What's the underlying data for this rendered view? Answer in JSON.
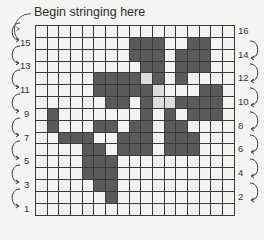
{
  "title": "Begin stringing here",
  "pattern": {
    "rows": 16,
    "cols": 17,
    "legend": {
      "0": "empty",
      "1": "filled",
      "2": "highlight"
    },
    "colors": {
      "empty": "#f2f2f1",
      "filled": "#5a5a5a",
      "highlight": "#dcdcdb",
      "grid_line": "#3a3a3a"
    },
    "cells": [
      [
        0,
        0,
        0,
        0,
        0,
        0,
        0,
        0,
        0,
        0,
        0,
        0,
        0,
        0,
        0,
        0,
        0
      ],
      [
        0,
        0,
        0,
        0,
        0,
        0,
        0,
        0,
        1,
        1,
        1,
        0,
        0,
        1,
        1,
        0,
        0
      ],
      [
        0,
        0,
        0,
        0,
        0,
        0,
        0,
        0,
        1,
        1,
        1,
        0,
        1,
        1,
        1,
        0,
        0
      ],
      [
        0,
        0,
        0,
        0,
        0,
        0,
        0,
        0,
        0,
        1,
        1,
        0,
        1,
        1,
        1,
        0,
        0
      ],
      [
        0,
        0,
        0,
        0,
        0,
        1,
        1,
        1,
        1,
        2,
        1,
        0,
        1,
        0,
        0,
        0,
        0
      ],
      [
        0,
        0,
        0,
        0,
        0,
        1,
        1,
        1,
        1,
        1,
        2,
        0,
        0,
        0,
        1,
        1,
        0
      ],
      [
        0,
        0,
        0,
        0,
        0,
        0,
        1,
        1,
        0,
        1,
        2,
        2,
        1,
        1,
        1,
        1,
        0
      ],
      [
        0,
        1,
        0,
        0,
        0,
        0,
        0,
        0,
        0,
        1,
        0,
        1,
        0,
        1,
        1,
        1,
        0
      ],
      [
        0,
        1,
        0,
        0,
        0,
        1,
        1,
        0,
        1,
        1,
        0,
        1,
        1,
        0,
        0,
        0,
        0
      ],
      [
        0,
        0,
        1,
        1,
        1,
        0,
        0,
        1,
        1,
        1,
        0,
        1,
        1,
        1,
        0,
        0,
        0
      ],
      [
        0,
        0,
        0,
        0,
        1,
        1,
        0,
        1,
        1,
        1,
        0,
        1,
        1,
        1,
        0,
        0,
        0
      ],
      [
        0,
        0,
        0,
        0,
        1,
        1,
        1,
        0,
        0,
        0,
        0,
        0,
        0,
        0,
        0,
        0,
        0
      ],
      [
        0,
        0,
        0,
        0,
        1,
        1,
        1,
        0,
        0,
        0,
        0,
        0,
        0,
        0,
        0,
        0,
        0
      ],
      [
        0,
        0,
        0,
        0,
        0,
        1,
        1,
        0,
        0,
        0,
        0,
        0,
        0,
        0,
        0,
        0,
        0
      ],
      [
        0,
        0,
        0,
        0,
        0,
        0,
        1,
        0,
        0,
        0,
        0,
        0,
        0,
        0,
        0,
        0,
        0
      ],
      [
        0,
        0,
        0,
        0,
        0,
        0,
        0,
        0,
        0,
        0,
        0,
        0,
        0,
        0,
        0,
        0,
        0
      ]
    ]
  },
  "left_labels": [
    "15",
    "13",
    "11",
    "9",
    "7",
    "5",
    "3",
    "1"
  ],
  "right_labels": [
    "16",
    "14",
    "12",
    "10",
    "8",
    "6",
    "4",
    "2"
  ]
}
